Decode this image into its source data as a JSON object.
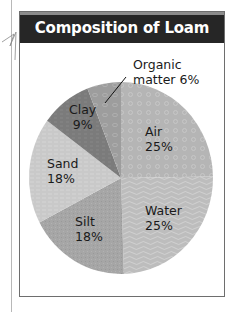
{
  "chart_data": {
    "type": "pie",
    "title": "Composition of Loam",
    "unit": "%",
    "slices": [
      {
        "label": "Air",
        "value": 25,
        "color": "#b5b5b5",
        "pattern": "circles"
      },
      {
        "label": "Water",
        "value": 25,
        "color": "#bfbfbf",
        "pattern": "contours"
      },
      {
        "label": "Silt",
        "value": 18,
        "color": "#a5a5a5",
        "pattern": "stipple"
      },
      {
        "label": "Sand",
        "value": 18,
        "color": "#c9c9c9",
        "pattern": "fine-lines"
      },
      {
        "label": "Clay",
        "value": 9,
        "color": "#7b7b7b",
        "pattern": "dashes"
      },
      {
        "label": "Organic matter",
        "value": 6,
        "color": "#9d9d9d",
        "pattern": "ovals"
      }
    ],
    "start_angle": "12 o'clock",
    "direction": "clockwise",
    "legend": "none (direct labels)"
  },
  "labels": {
    "title": "Composition of Loam",
    "organic_line1": "Organic",
    "organic_line2": "matter 6%",
    "clay_name": "Clay",
    "clay_pct": "9%",
    "air_name": "Air",
    "air_pct": "25%",
    "sand_name": "Sand",
    "sand_pct": "18%",
    "silt_name": "Silt",
    "silt_pct": "18%",
    "water_name": "Water",
    "water_pct": "25%"
  }
}
